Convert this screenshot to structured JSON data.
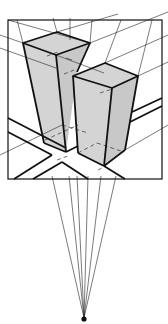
{
  "diagram": {
    "title": "",
    "colors": {
      "line": "#111111",
      "face_fill": "#d4d4d4",
      "background": "#ffffff"
    },
    "elements": [
      {
        "name": "picture-frame",
        "kind": "rectangle"
      },
      {
        "name": "tall-block",
        "kind": "box",
        "shaded": true
      },
      {
        "name": "short-block",
        "kind": "box",
        "shaded": true
      },
      {
        "name": "ground-roads",
        "kind": "parallel-lines"
      },
      {
        "name": "construction-lines",
        "kind": "guide-lines"
      },
      {
        "name": "vanishing-point",
        "kind": "point"
      }
    ]
  }
}
